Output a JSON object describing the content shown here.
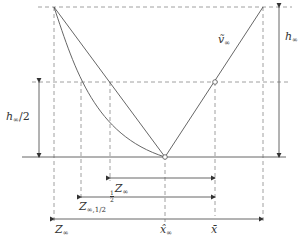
{
  "diagram": {
    "labels": {
      "v_inf": {
        "base": "ṽ",
        "sub": "∞"
      },
      "h_inf": {
        "base": "h",
        "sub": "∞"
      },
      "h_inf_half": {
        "base": "h",
        "sub": "∞",
        "suffix": "/2"
      },
      "half_z": {
        "num": "1",
        "den": "2",
        "base": "Z",
        "sub": "∞"
      },
      "z_inf_half": {
        "base": "Z",
        "sub": "∞,1/2"
      },
      "z_inf": {
        "base": "Z",
        "sub": "∞"
      },
      "x_hat_inf": {
        "base": "x̂",
        "sub": "∞"
      },
      "x_bar": {
        "base": "x̄"
      }
    },
    "colors": {
      "line": "#555555",
      "dashed": "#777777",
      "text": "#333333",
      "background": "#ffffff"
    }
  }
}
